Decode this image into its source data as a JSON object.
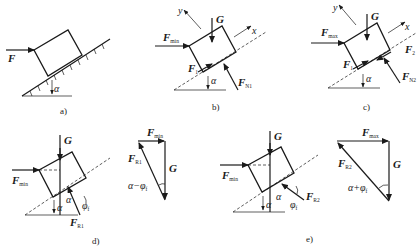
{
  "figure": {
    "panels": [
      {
        "id": "a",
        "caption": "a)",
        "labels": {
          "force": "F",
          "angle": "α"
        }
      },
      {
        "id": "b",
        "caption": "b)",
        "labels": {
          "y_axis": "y",
          "x_axis": "x",
          "gravity": "G",
          "push": "F",
          "push_sub": "min",
          "friction": "F",
          "friction_sub": "1",
          "normal": "F",
          "normal_sub": "N1",
          "angle": "α"
        }
      },
      {
        "id": "c",
        "caption": "c)",
        "labels": {
          "y_axis": "y",
          "x_axis": "x",
          "gravity": "G",
          "push": "F",
          "push_sub": "max",
          "friction1": "F",
          "friction1_sub": "1",
          "friction2": "F",
          "friction2_sub": "2",
          "normal": "F",
          "normal_sub": "N2",
          "angle": "α"
        }
      },
      {
        "id": "d",
        "caption": "d)",
        "labels": {
          "gravity": "G",
          "push": "F",
          "push_sub": "min",
          "reaction": "F",
          "reaction_sub": "R1",
          "angle1": "α",
          "angle2": "α",
          "friction_angle": "φ",
          "friction_angle_sub": "f"
        },
        "triangle": {
          "top": "F",
          "top_sub": "min",
          "side": "F",
          "side_sub": "R1",
          "vertical": "G",
          "angle": "α−φ",
          "angle_sub": "f"
        }
      },
      {
        "id": "e",
        "caption": "e)",
        "labels": {
          "gravity": "G",
          "push": "F",
          "push_sub": "min",
          "reaction": "F",
          "reaction_sub": "R2",
          "angle1": "α",
          "angle2": "α",
          "friction_angle": "φ",
          "friction_angle_sub": "f"
        },
        "triangle": {
          "top": "F",
          "top_sub": "max",
          "side": "F",
          "side_sub": "R2",
          "vertical": "G",
          "angle": "α+φ",
          "angle_sub": "f"
        }
      }
    ]
  }
}
